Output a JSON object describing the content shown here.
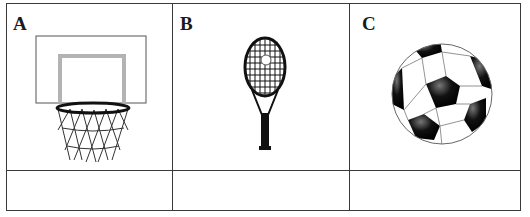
{
  "worksheet": {
    "cells": [
      {
        "label": "A",
        "image": "basketball-hoop",
        "answer": ""
      },
      {
        "label": "B",
        "image": "tennis-racket",
        "answer": ""
      },
      {
        "label": "C",
        "image": "soccer-ball",
        "answer": ""
      }
    ]
  },
  "colors": {
    "border": "#3a3a3a",
    "backboard_inner": "#b3b3b3",
    "ink": "#111111"
  }
}
